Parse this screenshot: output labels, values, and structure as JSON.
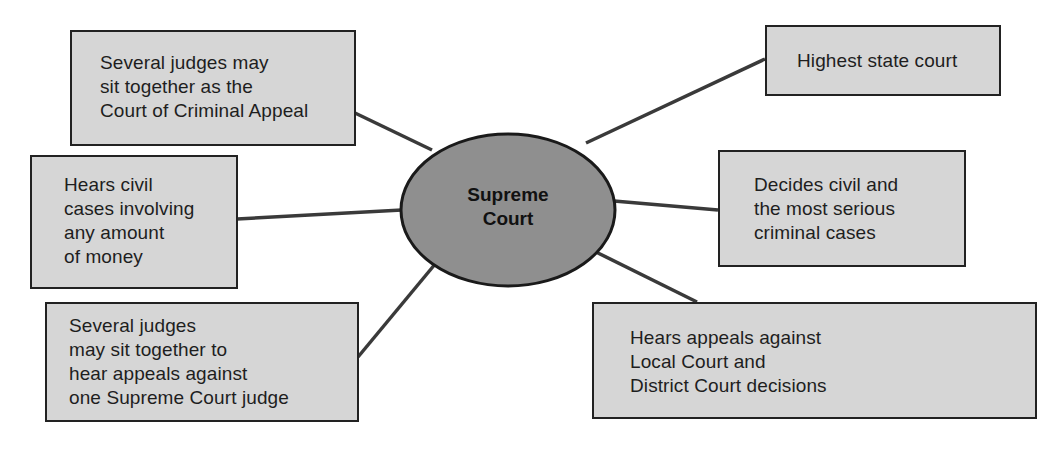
{
  "diagram": {
    "type": "hub-and-spoke",
    "colors": {
      "background": "#ffffff",
      "box_fill": "#d6d6d6",
      "hub_fill": "#8f8f8f",
      "stroke": "#222222"
    },
    "hub": {
      "lines": [
        "Supreme",
        "Court"
      ]
    },
    "nodes": [
      {
        "id": "criminal-appeal",
        "position": "top-left",
        "lines": [
          "Several judges may",
          "sit together as the",
          "Court of Criminal Appeal"
        ]
      },
      {
        "id": "civil-cases-money",
        "position": "middle-left",
        "lines": [
          "Hears civil",
          "cases involving",
          "any amount",
          "of money"
        ]
      },
      {
        "id": "appeals-one-judge",
        "position": "bottom-left",
        "lines": [
          "Several judges",
          "may sit together to",
          "hear appeals against",
          "one Supreme Court judge"
        ]
      },
      {
        "id": "highest-state-court",
        "position": "top-right",
        "lines": [
          "Highest state court"
        ]
      },
      {
        "id": "civil-serious-criminal",
        "position": "middle-right",
        "lines": [
          "Decides civil and",
          "the most serious",
          "criminal cases"
        ]
      },
      {
        "id": "appeals-local-district",
        "position": "bottom-right",
        "lines": [
          "Hears appeals against",
          "Local Court and",
          "District Court decisions"
        ]
      }
    ]
  }
}
